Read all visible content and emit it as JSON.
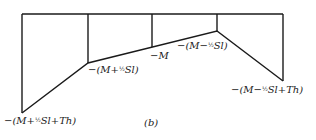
{
  "figure": {
    "caption": "(b)",
    "line_color": "#1a1a1a",
    "baseline": {
      "y": 14,
      "x_start": 22,
      "x_end": 283
    },
    "verticals": [
      {
        "x": 22,
        "y_bottom": 113
      },
      {
        "x": 88,
        "y_bottom": 63
      },
      {
        "x": 152,
        "y_bottom": 47
      },
      {
        "x": 217,
        "y_bottom": 31
      },
      {
        "x": 283,
        "y_bottom": 81
      }
    ],
    "polyline": [
      [
        22,
        113
      ],
      [
        88,
        63
      ],
      [
        217,
        31
      ],
      [
        283,
        81
      ]
    ],
    "labels": {
      "left_bottom": {
        "pre": "−(M+",
        "frac": "½",
        "post": "Sl+Th)"
      },
      "second": {
        "pre": "−(M+",
        "frac": "½",
        "post": "Sl)"
      },
      "middle": {
        "text": "−M"
      },
      "fourth": {
        "pre": "−(M−",
        "frac": "½",
        "post": "Sl)"
      },
      "right_bottom": {
        "pre": "−(M−",
        "frac": "½",
        "post": "Sl+Th)"
      }
    }
  }
}
